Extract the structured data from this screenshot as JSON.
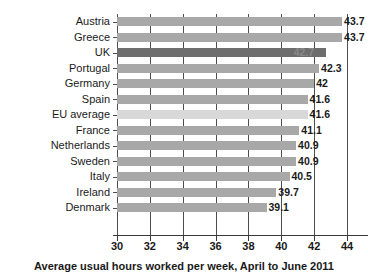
{
  "chart_data": {
    "type": "bar",
    "orientation": "horizontal",
    "title": "",
    "caption": "Average usual hours worked per week, April to June 2011",
    "xlabel": "Average usual hours worked per week, April to June 2011",
    "ylabel": "",
    "xlim": [
      30,
      44
    ],
    "xticks": [
      30,
      32,
      34,
      36,
      38,
      40,
      42,
      44
    ],
    "xtick_labels": [
      "30",
      "32",
      "34",
      "36",
      "38",
      "40",
      "42",
      "44"
    ],
    "grid": "vertical",
    "legend": "none",
    "categories": [
      "Austria",
      "Greece",
      "UK",
      "Portugal",
      "Germany",
      "Spain",
      "EU average",
      "France",
      "Netherlands",
      "Sweden",
      "Italy",
      "Ireland",
      "Denmark"
    ],
    "values": [
      43.7,
      43.7,
      42.7,
      42.3,
      42,
      41.6,
      41.6,
      41.1,
      40.9,
      40.9,
      40.5,
      39.7,
      39.1
    ],
    "value_labels": [
      "43.7",
      "43.7",
      "42.7",
      "42.3",
      "42",
      "41.6",
      "41.6",
      "41.1",
      "40.9",
      "40.9",
      "40.5",
      "39.7",
      "39.1"
    ],
    "highlight_category": "UK",
    "bar_styles": [
      "mid",
      "mid",
      "dark",
      "mid",
      "mid",
      "mid",
      "light",
      "mid",
      "mid",
      "mid",
      "mid",
      "mid",
      "mid"
    ],
    "label_placement": [
      "outside",
      "outside",
      "inside",
      "outside",
      "outside",
      "outside",
      "outside",
      "outside",
      "outside",
      "outside",
      "outside",
      "outside",
      "outside"
    ],
    "colors": {
      "bar_default": "#b4b4b4",
      "bar_highlight": "#6e6e6e",
      "bar_light": "#d8d8d8",
      "gridline": "#4d4d4d",
      "axis": "#3a3a3a",
      "text": "#1a1a1a",
      "background": "#ffffff"
    }
  }
}
